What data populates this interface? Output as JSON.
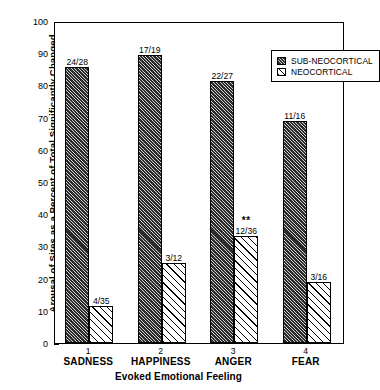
{
  "chart_data": {
    "type": "bar",
    "title": "",
    "xlabel": "Evoked Emotional Feeling",
    "ylabel": "Arousal of Sites as a Percent of Total Significantly Changed",
    "categories": [
      "SADNESS",
      "HAPPINESS",
      "ANGER",
      "FEAR"
    ],
    "category_numbers": [
      "1",
      "2",
      "3",
      "4"
    ],
    "ylim": [
      0,
      100
    ],
    "yticks": [
      "0",
      "10",
      "20",
      "30",
      "40",
      "50",
      "60",
      "70",
      "80",
      "90",
      "100"
    ],
    "grid": false,
    "legend_position": "top-right",
    "series": [
      {
        "name": "SUB-NEOCORTICAL",
        "fill": "dark-hatch",
        "values": [
          85.7,
          89.5,
          81.5,
          68.8
        ],
        "data_labels": [
          "24/28",
          "17/19",
          "22/27",
          "11/16"
        ],
        "annotations": [
          "",
          "",
          "",
          ""
        ]
      },
      {
        "name": "NEOCORTICAL",
        "fill": "light-hatch",
        "values": [
          11.4,
          25.0,
          33.3,
          18.8
        ],
        "data_labels": [
          "4/35",
          "3/12",
          "12/36",
          "3/16"
        ],
        "annotations": [
          "",
          "",
          "**",
          ""
        ]
      }
    ]
  },
  "legend": {
    "items": [
      {
        "label": "SUB-NEOCORTICAL",
        "swatch": "dark-hatch"
      },
      {
        "label": "NEOCORTICAL",
        "swatch": "light-hatch"
      }
    ]
  },
  "colors": {
    "axis": "#000000",
    "bar_dark": "#2b2b2b",
    "bar_light": "#ffffff",
    "background": "#ffffff"
  }
}
